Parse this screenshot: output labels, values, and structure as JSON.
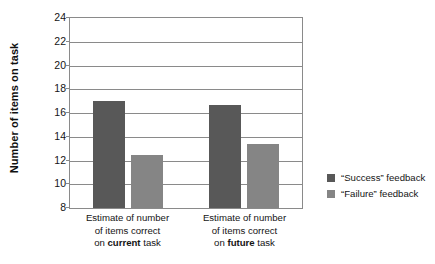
{
  "chart_data": {
    "type": "bar",
    "title": "",
    "xlabel": "",
    "ylabel": "Number of items on task",
    "ylim": [
      8,
      24
    ],
    "yticks": [
      8,
      10,
      12,
      14,
      16,
      18,
      20,
      22,
      24
    ],
    "grid": true,
    "legend_position": "right",
    "categories": [
      "Estimate of number of items correct on current task",
      "Estimate of number of items correct on future task"
    ],
    "category_lines": [
      [
        "Estimate of number",
        "of items correct",
        "on ",
        "current",
        " task"
      ],
      [
        "Estimate of number",
        "of items correct",
        "on ",
        "future",
        " task"
      ]
    ],
    "series": [
      {
        "name": "“Success” feedback",
        "color": "#585858",
        "values": [
          17.0,
          16.7
        ]
      },
      {
        "name": "“Failure” feedback",
        "color": "#858585",
        "values": [
          12.5,
          13.4
        ]
      }
    ]
  },
  "axis": {
    "y_title": "Number of items on task",
    "y_tick_labels": [
      "24",
      "22",
      "20",
      "18",
      "16",
      "14",
      "12",
      "10",
      "8"
    ]
  },
  "categories": {
    "group1": {
      "line1": "Estimate of number",
      "line2": "of items correct",
      "line3_prefix": "on ",
      "line3_bold": "current",
      "line3_suffix": " task"
    },
    "group2": {
      "line1": "Estimate of number",
      "line2": "of items correct",
      "line3_prefix": "on ",
      "line3_bold": "future",
      "line3_suffix": " task"
    }
  },
  "legend": {
    "items": [
      {
        "label": "“Success” feedback",
        "color": "#585858"
      },
      {
        "label": "“Failure” feedback",
        "color": "#858585"
      }
    ]
  }
}
